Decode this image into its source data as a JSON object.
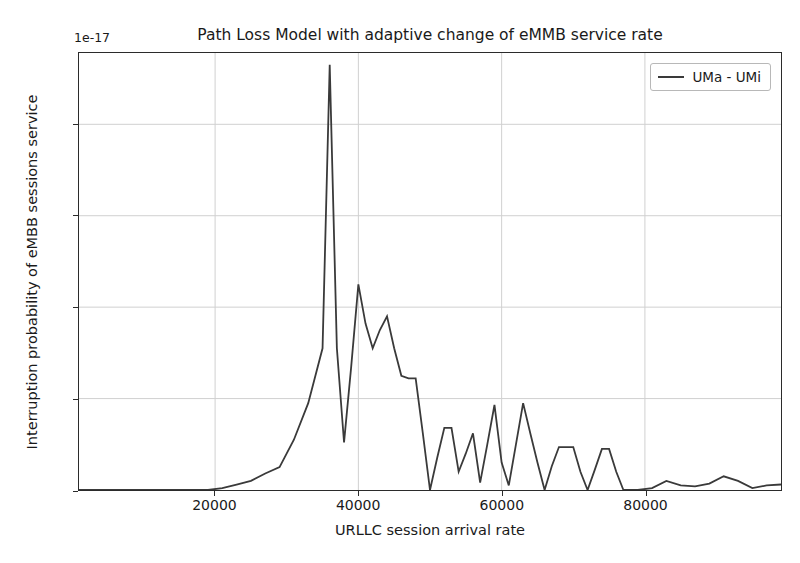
{
  "chart_data": {
    "type": "line",
    "title": "Path Loss Model with adaptive change of eMMB service rate",
    "subtitle": "",
    "xlabel": "URLLC session arrival rate",
    "ylabel": "Interruption probability of eMBB sessions service",
    "y_offset_text": "1e-17",
    "y_scale_exponent": -17,
    "xlim": [
      1000,
      99000
    ],
    "ylim": [
      0,
      4.78
    ],
    "xticks": [
      20000,
      40000,
      60000,
      80000
    ],
    "xtick_labels": [
      "20000",
      "40000",
      "60000",
      "80000"
    ],
    "yticks": [
      0,
      1,
      2,
      3,
      4
    ],
    "ytick_labels": [
      "0",
      "1",
      "2",
      "3",
      "4"
    ],
    "grid": true,
    "grid_color": "#d0d0d0",
    "legend_position": "upper right",
    "line_color": "#3a3a3a",
    "line_width": 1.8,
    "series": [
      {
        "name": "UMa - UMi",
        "x": [
          1000,
          3000,
          5000,
          7000,
          9000,
          11000,
          13000,
          15000,
          17000,
          19000,
          21000,
          23000,
          25000,
          27000,
          29000,
          31000,
          33000,
          35000,
          36000,
          37000,
          38000,
          39000,
          40000,
          41000,
          42000,
          43000,
          44000,
          45000,
          46000,
          47000,
          48000,
          49000,
          50000,
          51000,
          52000,
          53000,
          54000,
          55000,
          56000,
          57000,
          58000,
          59000,
          60000,
          61000,
          62000,
          63000,
          64000,
          65000,
          66000,
          67000,
          68000,
          69000,
          70000,
          71000,
          72000,
          73000,
          74000,
          75000,
          76000,
          77000,
          78000,
          79000,
          81000,
          83000,
          85000,
          87000,
          89000,
          91000,
          93000,
          95000,
          97000,
          99000
        ],
        "y": [
          0.0,
          0.0,
          0.0,
          0.0,
          0.0,
          0.0,
          0.0,
          0.0,
          0.0,
          0.0,
          0.02,
          0.06,
          0.1,
          0.18,
          0.25,
          0.55,
          0.95,
          1.55,
          4.65,
          1.55,
          0.52,
          1.35,
          2.25,
          1.82,
          1.55,
          1.75,
          1.9,
          1.55,
          1.25,
          1.22,
          1.22,
          0.62,
          0.0,
          0.35,
          0.68,
          0.68,
          0.2,
          0.4,
          0.62,
          0.08,
          0.5,
          0.93,
          0.3,
          0.05,
          0.5,
          0.95,
          0.62,
          0.3,
          0.0,
          0.26,
          0.47,
          0.47,
          0.47,
          0.2,
          0.0,
          0.22,
          0.45,
          0.45,
          0.2,
          0.0,
          0.0,
          0.0,
          0.02,
          0.1,
          0.05,
          0.04,
          0.07,
          0.15,
          0.1,
          0.02,
          0.05,
          0.06
        ]
      }
    ]
  },
  "legend": {
    "entries": [
      {
        "label": "UMa - UMi",
        "color": "#3a3a3a"
      }
    ]
  }
}
